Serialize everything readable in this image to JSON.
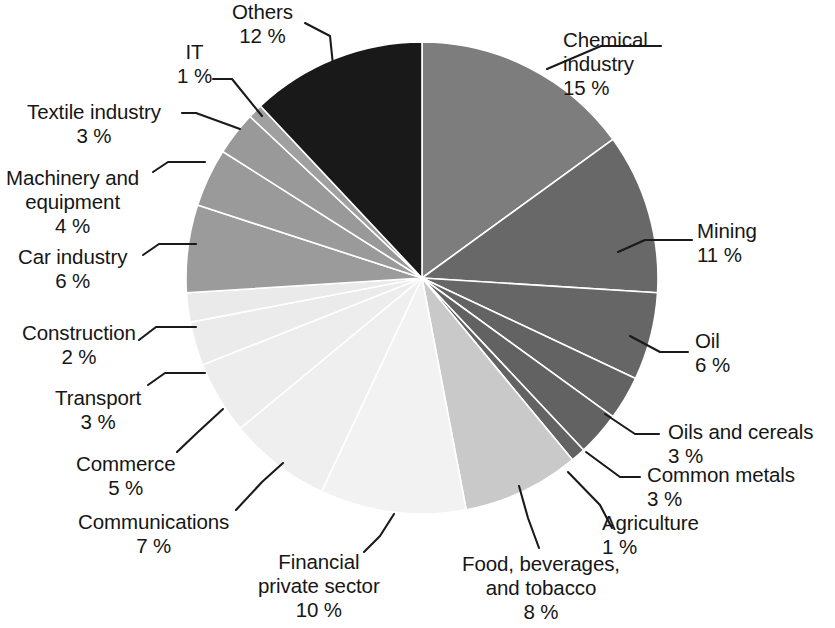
{
  "chart_data": {
    "type": "pie",
    "title": "",
    "subtitle": "",
    "xlabel": "",
    "ylabel": "",
    "legend_position": "none",
    "grid": false,
    "label_format": "name + percent",
    "start_angle_deg": 0,
    "direction": "clockwise",
    "total_percent": 100,
    "categories": [
      "Chemical industry",
      "Mining",
      "Oil",
      "Oils and cereals",
      "Common metals",
      "Agriculture",
      "Food, beverages, and tobacco",
      "Financial private sector",
      "Communications",
      "Commerce",
      "Transport",
      "Construction",
      "Car industry",
      "Machinery and equipment",
      "Textile industry",
      "IT",
      "Others"
    ],
    "values": [
      15,
      11,
      6,
      3,
      3,
      1,
      8,
      10,
      7,
      5,
      3,
      2,
      6,
      4,
      3,
      1,
      12
    ],
    "colors": [
      "#7d7d7d",
      "#686868",
      "#666666",
      "#636363",
      "#626262",
      "#636363",
      "#c9c9c9",
      "#f2f2f2",
      "#efefef",
      "#ededed",
      "#ebebeb",
      "#eaeaea",
      "#9b9b9b",
      "#9a9a9a",
      "#999999",
      "#a0a0a0",
      "#191919"
    ]
  },
  "slices": [
    {
      "id": "chemical-industry",
      "label": "Chemical\nindustry",
      "percent": "15 %"
    },
    {
      "id": "mining",
      "label": "Mining",
      "percent": "11 %"
    },
    {
      "id": "oil",
      "label": "Oil",
      "percent": "6 %"
    },
    {
      "id": "oils-and-cereals",
      "label": "Oils and cereals",
      "percent": "3 %"
    },
    {
      "id": "common-metals",
      "label": "Common metals",
      "percent": "3 %"
    },
    {
      "id": "agriculture",
      "label": "Agriculture",
      "percent": "1 %"
    },
    {
      "id": "food-beverages",
      "label": "Food, beverages,\nand tobacco",
      "percent": "8 %"
    },
    {
      "id": "financial",
      "label": "Financial\nprivate sector",
      "percent": "10 %"
    },
    {
      "id": "communications",
      "label": "Communications",
      "percent": "7 %"
    },
    {
      "id": "commerce",
      "label": "Commerce",
      "percent": "5 %"
    },
    {
      "id": "transport",
      "label": "Transport",
      "percent": "3 %"
    },
    {
      "id": "construction",
      "label": "Construction",
      "percent": "2 %"
    },
    {
      "id": "car-industry",
      "label": "Car industry",
      "percent": "6 %"
    },
    {
      "id": "machinery",
      "label": "Machinery and\nequipment",
      "percent": "4 %"
    },
    {
      "id": "textile-industry",
      "label": "Textile industry",
      "percent": "3 %"
    },
    {
      "id": "it",
      "label": "IT",
      "percent": "1 %"
    },
    {
      "id": "others",
      "label": "Others",
      "percent": "12 %"
    }
  ],
  "geometry": {
    "center_x": 422,
    "center_y": 278,
    "radius": 236
  },
  "callouts": [
    {
      "id": "chemical-industry",
      "x": 563,
      "y": 28,
      "align": "ta-left",
      "leader": "661,46 601,46 547,69"
    },
    {
      "id": "mining",
      "x": 697,
      "y": 219,
      "align": "ta-left",
      "leader": "692,240 645,240 618,252"
    },
    {
      "id": "oil",
      "x": 695,
      "y": 329,
      "align": "ta-left",
      "leader": "688,352 660,352 630,336"
    },
    {
      "id": "oils-and-cereals",
      "x": 668,
      "y": 420,
      "align": "ta-left",
      "leader": "659,434 635,434 605,414"
    },
    {
      "id": "common-metals",
      "x": 647,
      "y": 463,
      "align": "ta-left",
      "leader": "640,477 620,477 586,452"
    },
    {
      "id": "agriculture",
      "x": 602,
      "y": 511,
      "align": "ta-left",
      "leader": "612,528 600,505 568,472"
    },
    {
      "id": "food-beverages",
      "x": 462,
      "y": 552,
      "align": "ta-center",
      "leader": "539,548 528,518 519,486"
    },
    {
      "id": "financial",
      "x": 258,
      "y": 550,
      "align": "ta-center",
      "leader": "364,552 380,536 394,514"
    },
    {
      "id": "communications",
      "x": 78,
      "y": 510,
      "align": "ta-center",
      "leader": "236,510 262,482 283,463"
    },
    {
      "id": "commerce",
      "x": 76,
      "y": 452,
      "align": "ta-center",
      "leader": "177,452 198,432 223,409"
    },
    {
      "id": "transport",
      "x": 55,
      "y": 386,
      "align": "ta-center",
      "leader": "148,385 165,373 205,373"
    },
    {
      "id": "construction",
      "x": 22,
      "y": 321,
      "align": "ta-center",
      "leader": "139,340 156,327 196,327"
    },
    {
      "id": "car-industry",
      "x": 18,
      "y": 245,
      "align": "ta-center",
      "leader": "143,255 159,244 196,244"
    },
    {
      "id": "machinery",
      "x": 6,
      "y": 166,
      "align": "ta-center",
      "leader": "153,172 168,162 205,162"
    },
    {
      "id": "textile-industry",
      "x": 27,
      "y": 100,
      "align": "ta-center",
      "leader": "182,113 196,113 240,129"
    },
    {
      "id": "it",
      "x": 177,
      "y": 40,
      "align": "ta-center",
      "leader": "213,79 232,79 262,116"
    },
    {
      "id": "others",
      "x": 232,
      "y": 0,
      "align": "ta-center",
      "leader": "305,23 330,36 333,65"
    }
  ]
}
